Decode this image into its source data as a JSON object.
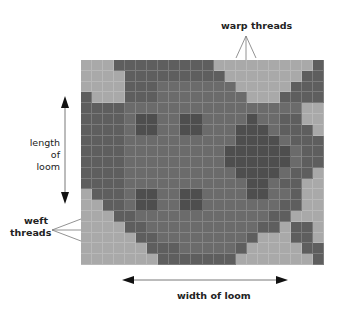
{
  "labels": {
    "warp": "warp threads",
    "length_line1": "length of",
    "length_line2": "loom",
    "weft_line1": "weft",
    "weft_line2": "threads",
    "width": "width of loom"
  },
  "colors": {
    "light": "#a9a9a9",
    "dark": "#5e5e5e",
    "medium": "#6b6b6b",
    "darker": "#4e4e4e"
  },
  "grid": {
    "columns": 22,
    "rows": 19,
    "legend": {
      "0": "light",
      "1": "dark",
      "2": "medium",
      "3": "darker"
    },
    "cells": [
      "0001111111110000000001",
      "0000111111111000000011",
      "0000111222222200000111",
      "1000111222222220001111",
      "1111222222222222222200",
      "1111233223322223221100",
      "1111233223322233321110",
      "1111222222222233332111",
      "1111222222222333333211",
      "1111222222222333333211",
      "1111222222222233332110",
      "1111222222222223321100",
      "0111233223322223322100",
      "0011233223322222221100",
      "0001122222222222211000",
      "0000112222222222110110",
      "0000011222222221000110",
      "0000001112222210000011",
      "0000000111111100000001"
    ]
  }
}
